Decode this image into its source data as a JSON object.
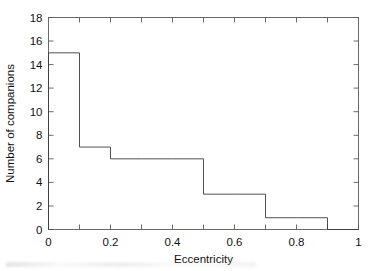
{
  "chart_data": {
    "type": "bar",
    "title": "",
    "subtitle": "",
    "xlabel": "Eccentricity",
    "ylabel": "Number of companions",
    "xlim": [
      0,
      1
    ],
    "ylim": [
      0,
      18
    ],
    "grid": false,
    "legend": null,
    "bin_width": 0.1,
    "bin_edges": [
      0,
      0.1,
      0.2,
      0.3,
      0.4,
      0.5,
      0.6,
      0.7,
      0.8,
      0.9,
      1.0
    ],
    "categories": [
      "0-0.1",
      "0.1-0.2",
      "0.2-0.3",
      "0.3-0.4",
      "0.4-0.5",
      "0.5-0.6",
      "0.6-0.7",
      "0.7-0.8",
      "0.8-0.9",
      "0.9-1.0"
    ],
    "values": [
      15,
      7,
      6,
      6,
      6,
      3,
      3,
      1,
      1,
      0
    ],
    "xticks": [
      0,
      0.2,
      0.4,
      0.6,
      0.8,
      1
    ],
    "xtick_labels": [
      "0",
      "0.2",
      "0.4",
      "0.6",
      "0.8",
      "1"
    ],
    "xminor_ticks": [
      0.1,
      0.3,
      0.5,
      0.7,
      0.9
    ],
    "yticks": [
      0,
      2,
      4,
      6,
      8,
      10,
      12,
      14,
      16,
      18
    ],
    "ytick_labels": [
      "0",
      "2",
      "4",
      "6",
      "8",
      "10",
      "12",
      "14",
      "16",
      "18"
    ],
    "colors": {
      "axis": "#5a5a5a",
      "bar_outline": "#3c3c3c",
      "bar_fill": "#ffffff",
      "background": "#ffffff",
      "text": "#111111"
    }
  }
}
